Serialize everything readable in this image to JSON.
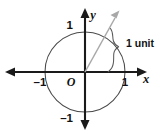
{
  "figure": {
    "kind": "unit-circle-diagram",
    "background_color": "#ffffff"
  },
  "axes": {
    "x_axis_label": "x",
    "y_axis_label": "y",
    "origin_label": "O",
    "x_ticks": [
      {
        "value": -1,
        "label": "–1"
      },
      {
        "value": 1,
        "label": "1"
      }
    ],
    "y_ticks": [
      {
        "value": 1,
        "label": "1"
      },
      {
        "value": -1,
        "label": "–1"
      }
    ],
    "axis_color": "#1a1a1a",
    "x_range": [
      -1.9,
      1.9
    ],
    "y_range": [
      -1.55,
      1.55
    ]
  },
  "circle": {
    "center": [
      0,
      0
    ],
    "radius": 1,
    "stroke_color": "#4a4a4a"
  },
  "ray": {
    "from": [
      0,
      0
    ],
    "angle_degrees": 57,
    "has_arrowhead": true,
    "stroke_color": "#a8a8a8"
  },
  "annotation": {
    "label": "1 unit",
    "marker": "curly-brace",
    "describes": "arc length from positive x-axis to ray",
    "stroke_color": "#5a5a5a"
  }
}
